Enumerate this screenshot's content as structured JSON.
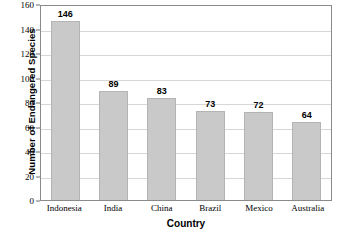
{
  "chart_data": {
    "type": "bar",
    "title": "",
    "subtitle": "",
    "xlabel": "Country",
    "ylabel": "Number of Endangered Species",
    "categories": [
      "Indonesia",
      "India",
      "China",
      "Brazil",
      "Mexico",
      "Australia"
    ],
    "values": [
      146,
      89,
      83,
      73,
      72,
      64
    ],
    "data_labels": [
      "146",
      "89",
      "83",
      "73",
      "72",
      "64"
    ],
    "ylim": [
      0,
      160
    ],
    "y_ticks": [
      0,
      20,
      40,
      60,
      80,
      100,
      120,
      140,
      160
    ],
    "y_tick_labels": [
      "0",
      "20",
      "40",
      "60",
      "80",
      "100",
      "120",
      "140",
      "160"
    ],
    "grid": true,
    "grid_axis": "y",
    "legend": false,
    "legend_position": "none",
    "bar_color": "#c9c9c9",
    "bar_border_color": "#b4b4b4",
    "grid_color": "#d7d7d7",
    "axis_color": "#8a8a8a",
    "background_color": "#ffffff",
    "text_color": "#000000"
  }
}
